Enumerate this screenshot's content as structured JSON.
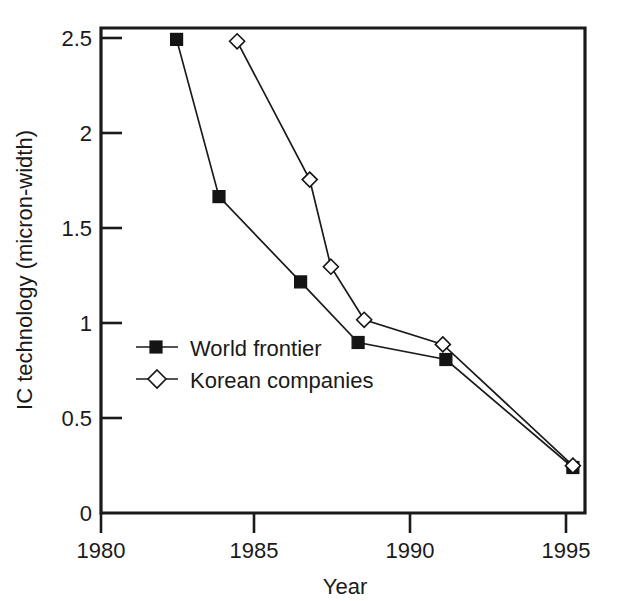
{
  "chart_data": {
    "type": "line",
    "title": "",
    "subtitle": "",
    "xlabel": "Year",
    "ylabel": "IC technology (micron-width)",
    "xlim": [
      1980,
      1996
    ],
    "ylim": [
      0,
      2.56
    ],
    "xticks": [
      1980,
      1985,
      1990,
      1995
    ],
    "xtick_labels": [
      "1980",
      "1985",
      "1990",
      "1995"
    ],
    "yticks": [
      0,
      0.5,
      1,
      1.5,
      2,
      2.5
    ],
    "ytick_labels": [
      "0",
      "0.5",
      "1",
      "1.5",
      "2",
      "2.5"
    ],
    "grid": false,
    "legend_position": "center-left inside axes",
    "series": [
      {
        "name": "World frontier",
        "marker": "filled-square",
        "x": [
          1982.5,
          1983.9,
          1986.6,
          1988.5,
          1991.4,
          1995.6
        ],
        "values": [
          2.5,
          1.67,
          1.22,
          0.9,
          0.81,
          0.24
        ]
      },
      {
        "name": "Korean companies",
        "marker": "open-diamond",
        "x": [
          1984.5,
          1986.9,
          1987.6,
          1988.7,
          1991.3,
          1995.6
        ],
        "values": [
          2.49,
          1.76,
          1.3,
          1.02,
          0.89,
          0.25
        ]
      }
    ]
  },
  "axes": {
    "y_title": "IC technology (micron-width)",
    "x_title": "Year",
    "y_tick_labels": [
      "2.5",
      "2",
      "1.5",
      "1",
      "0.5",
      "0"
    ],
    "x_tick_labels": [
      "1980",
      "1985",
      "1990",
      "1995"
    ]
  },
  "legend": {
    "entries": [
      {
        "label": "World frontier",
        "marker": "filled-square-icon"
      },
      {
        "label": "Korean companies",
        "marker": "open-diamond-icon"
      }
    ]
  },
  "colors": {
    "ink": "#1a1a1a",
    "background": "#ffffff",
    "marker_fill": "#141414",
    "marker_open_fill": "#ffffff"
  }
}
